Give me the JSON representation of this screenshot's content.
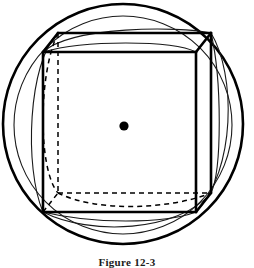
{
  "figure": {
    "caption": "Figure 12-3",
    "canvas": {
      "width": 254,
      "height": 266,
      "background": "#ffffff"
    },
    "colors": {
      "stroke": "#000000",
      "thin_stroke": "#1a1a1a",
      "hidden_stroke": "#000000",
      "center_dot": "#000000",
      "background": "#ffffff"
    },
    "center_point": {
      "label": "center",
      "cx": 124,
      "cy": 126,
      "r": 4.6
    },
    "outer_circle": {
      "label": "circumscribed-sphere-outline",
      "cx": 123,
      "cy": 124,
      "r": 120,
      "stroke_width": 2.6
    },
    "inner_circle": {
      "label": "second-sphere-outline",
      "cx": 123,
      "cy": 125,
      "r": 109,
      "stroke_width": 1.1
    },
    "cube": {
      "label": "cube",
      "front_face": {
        "x1": 43,
        "y1": 52,
        "x2": 196,
        "y2": 212
      },
      "depth_offset": {
        "dx": 15,
        "dy": -19
      },
      "stroke_width": 2.6,
      "hidden_stroke_width": 1.5,
      "hidden_dash": "5,4",
      "vertices": {
        "front_top_left": {
          "x": 43,
          "y": 52
        },
        "front_top_right": {
          "x": 196,
          "y": 52
        },
        "front_bottom_right": {
          "x": 196,
          "y": 212
        },
        "front_bottom_left": {
          "x": 43,
          "y": 212
        },
        "back_top_left": {
          "x": 58,
          "y": 33
        },
        "back_top_right": {
          "x": 211,
          "y": 33
        },
        "back_bottom_right": {
          "x": 211,
          "y": 193
        },
        "back_bottom_left": {
          "x": 58,
          "y": 193
        }
      }
    },
    "great_circles": [
      {
        "label": "great-circle-upper-visible",
        "stroke_width": 1.1,
        "visible": true,
        "path": "M 43 52 C 72 26 178 26 211 33"
      },
      {
        "label": "great-circle-upper-second",
        "stroke_width": 1.1,
        "visible": true,
        "path": "M 43 52 C 84 40 172 40 196 52"
      },
      {
        "label": "great-circle-left-visible",
        "stroke_width": 1.1,
        "visible": true,
        "path": "M 58 33 C 28 62 24 168 43 212"
      },
      {
        "label": "great-circle-right-visible",
        "stroke_width": 1.1,
        "visible": true,
        "path": "M 211 33 C 236 74 236 170 196 212"
      },
      {
        "label": "great-circle-right-second",
        "stroke_width": 1.1,
        "visible": true,
        "path": "M 211 33 C 222 80 222 170 211 193"
      },
      {
        "label": "great-circle-lower-visible",
        "stroke_width": 1.1,
        "visible": true,
        "path": "M 43 212 C 90 236 178 232 211 193"
      },
      {
        "label": "great-circle-lower-second",
        "stroke_width": 1.1,
        "visible": true,
        "path": "M 43 212 C 92 224 164 224 196 212"
      }
    ],
    "hidden_arcs": [
      {
        "label": "great-circle-left-hidden",
        "stroke_width": 1.5,
        "dash": "5,4",
        "path": "M 58 33 C 38 74 38 170 58 193"
      },
      {
        "label": "great-circle-bottom-hidden",
        "stroke_width": 1.5,
        "dash": "5,4",
        "path": "M 58 193 C 96 212 168 210 211 193"
      }
    ],
    "hidden_edges": [
      {
        "label": "hidden-edge-back-left-vertical",
        "x1": 58,
        "y1": 33,
        "x2": 58,
        "y2": 193
      },
      {
        "label": "hidden-edge-back-bottom",
        "x1": 58,
        "y1": 193,
        "x2": 211,
        "y2": 193
      },
      {
        "label": "hidden-edge-bottom-left-depth",
        "x1": 43,
        "y1": 212,
        "x2": 58,
        "y2": 193
      }
    ]
  }
}
